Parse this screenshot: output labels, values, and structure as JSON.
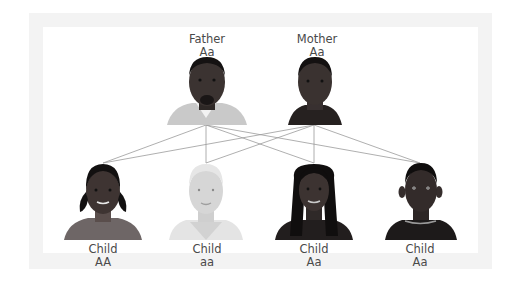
{
  "colors": {
    "frame": "#f3f3f3",
    "panel": "#ffffff",
    "line": "#9a9a9a",
    "text": "#4a4a4a",
    "dark_skin": "#3a3230",
    "light_skin": "#d8d8d8"
  },
  "parents": [
    {
      "role": "Father",
      "genotype": "Aa",
      "skin": "dark",
      "clothing": "light-collar-shirt"
    },
    {
      "role": "Mother",
      "genotype": "Aa",
      "skin": "dark",
      "clothing": "dark-jacket"
    }
  ],
  "children": [
    {
      "role": "Child",
      "genotype": "AA",
      "skin": "dark",
      "hair": "pigtails"
    },
    {
      "role": "Child",
      "genotype": "aa",
      "skin": "light",
      "hair": "short-light"
    },
    {
      "role": "Child",
      "genotype": "Aa",
      "skin": "dark",
      "hair": "long"
    },
    {
      "role": "Child",
      "genotype": "Aa",
      "skin": "dark",
      "hair": "short"
    }
  ]
}
